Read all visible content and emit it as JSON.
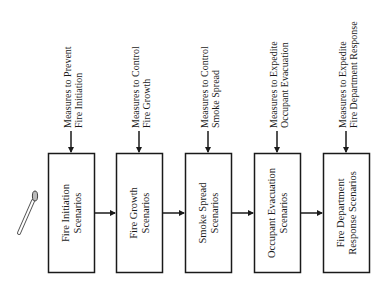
{
  "diagram": {
    "type": "flowchart",
    "orientation": "rotated-90-ccw",
    "ignition_icon": "match-icon",
    "colors": {
      "stroke": "#1a1a1a",
      "background": "#ffffff"
    },
    "stages": [
      {
        "box": [
          "Fire Initiation",
          "Scenarios"
        ],
        "measure": [
          "Measures to Prevent",
          "Fire Initiation"
        ]
      },
      {
        "box": [
          "Fire Growth",
          "Scenarios"
        ],
        "measure": [
          "Measures to Control",
          "Fire Growth"
        ]
      },
      {
        "box": [
          "Smoke Spread",
          "Scenarios"
        ],
        "measure": [
          "Measures to Control",
          "Smoke Spread"
        ]
      },
      {
        "box": [
          "Occupant Evacuation",
          "Scenarios"
        ],
        "measure": [
          "Measures to Expedite",
          "Occupant Evacuation"
        ]
      },
      {
        "box": [
          "Fire Department",
          "Response Scenarios"
        ],
        "measure": [
          "Measures to Expedite",
          "Fire Department Response"
        ]
      }
    ]
  }
}
